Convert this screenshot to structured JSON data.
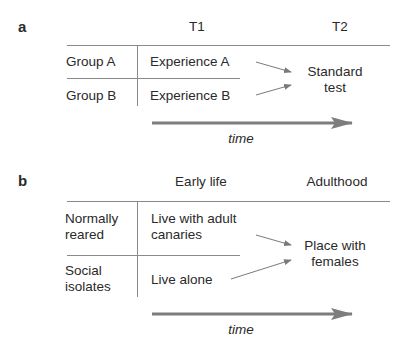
{
  "panels": [
    {
      "label": "a",
      "col1_header": "T1",
      "col2_header": "T2",
      "rows": [
        {
          "group": "Group A",
          "experience": "Experience A"
        },
        {
          "group": "Group B",
          "experience": "Experience B"
        }
      ],
      "outcome": [
        "Standard",
        "test"
      ],
      "axis_label": "time"
    },
    {
      "label": "b",
      "col1_header": "Early life",
      "col2_header": "Adulthood",
      "rows": [
        {
          "group": [
            "Normally",
            "reared"
          ],
          "experience": [
            "Live with adult",
            "canaries"
          ]
        },
        {
          "group": [
            "Social",
            "isolates"
          ],
          "experience": [
            "Live alone"
          ]
        }
      ],
      "outcome": [
        "Place with",
        "females"
      ],
      "axis_label": "time"
    }
  ],
  "colors": {
    "text": "#2a2a2a",
    "lines": "#8a8a8a",
    "arrows": "#7a7a7a",
    "time_arrow": "#7d7d7d"
  }
}
